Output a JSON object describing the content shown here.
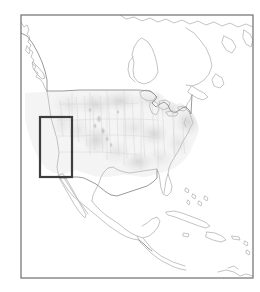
{
  "figure": {
    "type": "map",
    "title": "",
    "background_color": "#ffffff",
    "width": 260,
    "height": 292
  },
  "frame": {
    "name": "map-frame",
    "x": 21,
    "y": 15,
    "width": 232,
    "height": 263,
    "stroke_color": "#6e6e6e",
    "stroke_width": 1.2,
    "fill": "none"
  },
  "basemap": {
    "region": "North America",
    "coastline_color": "#b9b9b9",
    "coastline_width": 0.85,
    "border_color": "#8f8f8f",
    "border_width": 0.9,
    "land_fill": "#ffffff",
    "shading_layer": {
      "description": "faint gray raster shading over the conterminous United States",
      "color_light": "#ececec",
      "color_mid": "#dcdcdc",
      "color_dark": "#c3c3c3",
      "speckle_color": "#a8a8a8"
    },
    "features": [
      "Alaska panhandle",
      "British Columbia coast",
      "Vancouver Island",
      "Hudson Bay",
      "Great Lakes",
      "Atlantic coast",
      "Gulf of Mexico",
      "Florida peninsula",
      "Baja California",
      "Mexico",
      "Central America",
      "Cuba",
      "Hispaniola",
      "Bahamas"
    ]
  },
  "study_area": {
    "name": "study-area-box",
    "label": "",
    "x": 40,
    "y": 117,
    "width": 32,
    "height": 60,
    "stroke_color": "#3d3d3d",
    "stroke_width": 2.2,
    "fill": "none",
    "description": "highlighted rectangular study domain over the western United States"
  },
  "chart_data": {
    "type": "map",
    "title": "",
    "xlabel": "",
    "ylabel": "",
    "legend": [],
    "annotations": [
      {
        "kind": "rectangle",
        "name": "study-area-box",
        "text": "",
        "x": 40,
        "y": 117,
        "width": 32,
        "height": 60
      }
    ]
  }
}
